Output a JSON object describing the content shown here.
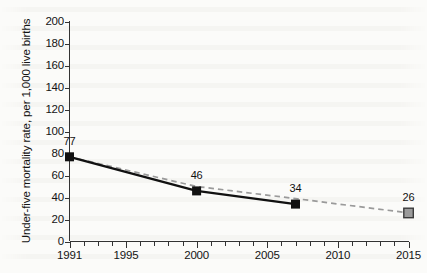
{
  "chart_data": {
    "type": "line",
    "title": "",
    "subtitle": "",
    "xlabel": "",
    "ylabel": "Under-five mortality rate, per 1,000 live births",
    "xlim": [
      1991,
      2015
    ],
    "ylim": [
      0,
      200
    ],
    "ytick_step": 20,
    "grid": false,
    "legend": "none",
    "x_ticks_every_year": true,
    "x_tick_labels": [
      "1991",
      "1995",
      "2000",
      "2005",
      "2010",
      "2015"
    ],
    "x_tick_label_values": [
      1991,
      1995,
      2000,
      2005,
      2010,
      2015
    ],
    "y_tick_labels": [
      "0",
      "20",
      "40",
      "60",
      "80",
      "100",
      "120",
      "140",
      "160",
      "180",
      "200"
    ],
    "y_tick_values": [
      0,
      20,
      40,
      60,
      80,
      100,
      120,
      140,
      160,
      180,
      200
    ],
    "series": [
      {
        "name": "observed",
        "style": "solid",
        "color": "#111111",
        "marker": "filled-square",
        "x": [
          1991,
          2000,
          2007
        ],
        "values": [
          77,
          46,
          34
        ],
        "point_labels": [
          "77",
          "46",
          "34"
        ]
      },
      {
        "name": "target-trend",
        "style": "dashed",
        "color": "#9a9a9a",
        "marker": "gray-square",
        "x": [
          1991,
          2000,
          2007,
          2015
        ],
        "values": [
          77,
          50,
          39,
          26
        ],
        "point_labels": [
          "",
          "",
          "",
          "26"
        ],
        "marker_only_at": [
          2015
        ]
      }
    ],
    "annotations": [
      {
        "text": "77",
        "x": 1991,
        "y": 77
      },
      {
        "text": "46",
        "x": 2000,
        "y": 46
      },
      {
        "text": "34",
        "x": 2007,
        "y": 34
      },
      {
        "text": "26",
        "x": 2015,
        "y": 26
      }
    ],
    "colors": {
      "line": "#111111",
      "trend": "#9a9a9a",
      "axis": "#333333",
      "background": "#fbfbf9",
      "target_marker_fill": "#9b9b9b",
      "target_marker_stroke": "#3a3a3a"
    }
  }
}
